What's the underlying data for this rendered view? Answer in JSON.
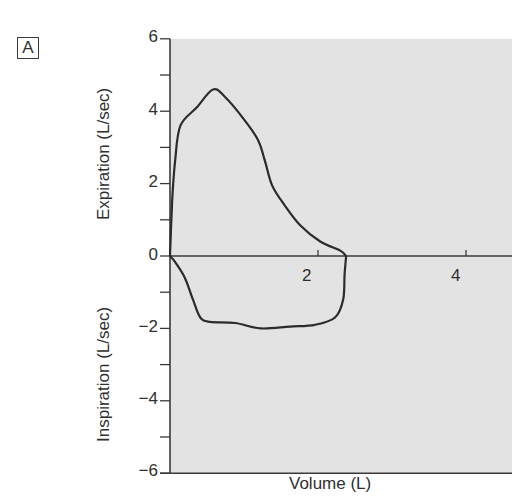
{
  "panel": {
    "label": "A"
  },
  "chart_data": {
    "type": "line",
    "title": "",
    "panel_label": "A",
    "xlabel": "Volume (L)",
    "ylabel_upper": "Expiration (L/sec)",
    "ylabel_lower": "Inspiration (L/sec)",
    "xlim": [
      0,
      4.6
    ],
    "ylim": [
      -6,
      6
    ],
    "x_ticks": [
      2,
      4
    ],
    "x_tick_labels": [
      "2",
      "4"
    ],
    "y_ticks": [
      6,
      5,
      4,
      3,
      2,
      1,
      0,
      -1,
      -2,
      -3,
      -4,
      -5,
      -6
    ],
    "y_tick_labels": {
      "6": "6",
      "4": "4",
      "2": "2",
      "0": "0",
      "-2": "−2",
      "-4": "−4",
      "-6": "−6"
    },
    "grid": false,
    "legend": null,
    "background": "#e3e3e3",
    "line_color": "#2b2b2b",
    "series": [
      {
        "name": "Expiratory limb",
        "x": [
          0,
          0.03,
          0.07,
          0.14,
          0.36,
          0.58,
          0.74,
          1.01,
          1.19,
          1.28,
          1.38,
          1.55,
          1.76,
          2.03,
          2.3,
          2.38
        ],
        "y": [
          0,
          1.55,
          2.65,
          3.6,
          4.1,
          4.6,
          4.4,
          3.75,
          3.2,
          2.65,
          1.95,
          1.4,
          0.85,
          0.4,
          0.15,
          0
        ]
      },
      {
        "name": "Inspiratory limb",
        "x": [
          2.38,
          2.36,
          2.34,
          2.23,
          1.96,
          1.62,
          1.22,
          0.88,
          0.54,
          0.41,
          0.31,
          0.2,
          0.07,
          0
        ],
        "y": [
          0,
          -0.5,
          -1.2,
          -1.7,
          -1.9,
          -1.95,
          -2.0,
          -1.85,
          -1.82,
          -1.7,
          -1.2,
          -0.6,
          -0.17,
          0
        ]
      }
    ],
    "annotations": []
  },
  "labels": {
    "xlabel": "Volume (L)",
    "ylabel_upper": "Expiration (L/sec)",
    "ylabel_lower": "Inspiration (L/sec)",
    "ytick_6": "6",
    "ytick_4": "4",
    "ytick_2": "2",
    "ytick_0": "0",
    "ytick_m2": "−2",
    "ytick_m4": "−4",
    "ytick_m6": "−6",
    "xtick_2": "2",
    "xtick_4": "4"
  }
}
